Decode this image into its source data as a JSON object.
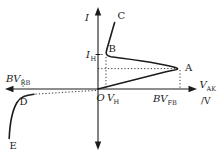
{
  "figure": {
    "kind": "thyristor-anode-characteristic",
    "colors": {
      "ink": "#1c1c1c",
      "background": "#ffffff"
    },
    "labels": {
      "y_axis": "I",
      "x_axis_main": "V",
      "x_axis_sub": "AK",
      "x_axis_unit": "/V",
      "origin": "O",
      "point_a": "A",
      "point_b": "B",
      "point_c": "C",
      "point_d": "D",
      "point_e": "E",
      "holding_current_main": "I",
      "holding_current_sub": "H",
      "holding_voltage_main": "V",
      "holding_voltage_sub": "H",
      "forward_breakover_main": "BV",
      "forward_breakover_sub": "FB",
      "reverse_breakdown_main": "BV",
      "reverse_breakdown_sub": "RB"
    }
  }
}
